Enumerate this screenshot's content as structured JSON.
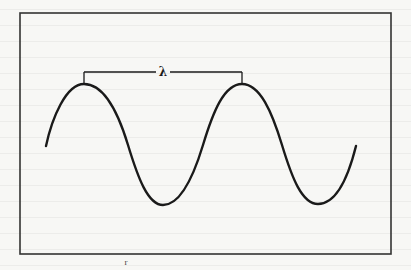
{
  "figure": {
    "type": "sine-wave-wavelength-diagram",
    "wavelength_label": "λ",
    "stray_mark": "r",
    "colors": {
      "background": "#f7f7f5",
      "stroke": "#1a1a1a",
      "frame": "#333333"
    },
    "frame": {
      "x": 20,
      "y": 13,
      "width": 371,
      "height": 241
    },
    "wave": {
      "start": [
        46,
        146
      ],
      "peaks": [
        [
          84,
          84
        ],
        [
          242,
          84
        ]
      ],
      "troughs": [
        [
          163,
          205
        ],
        [
          318,
          204
        ]
      ],
      "end": [
        356,
        146
      ],
      "period_px": 158,
      "amplitude_px": 60,
      "center_y": 145
    },
    "bracket": {
      "y": 72,
      "x_start": 84,
      "x_end": 242,
      "label_x": 163
    }
  }
}
